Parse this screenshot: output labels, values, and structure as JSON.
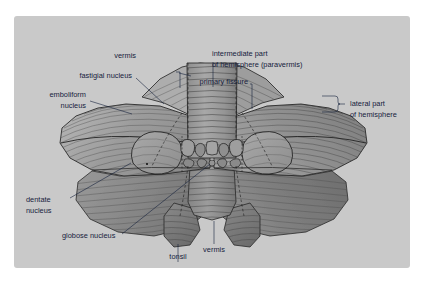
{
  "figure": {
    "background_color": "#c9c9c9",
    "page_color": "#ffffff",
    "label_color": "#16213c",
    "labels": [
      {
        "id": "vermis-superior",
        "text": "vermis"
      },
      {
        "id": "intermediate-part-1",
        "text": "intermediate part"
      },
      {
        "id": "intermediate-part-2",
        "text": "of hemisphere (paravermis)"
      },
      {
        "id": "fastigial-nucleus",
        "text": "fastigial nucleus"
      },
      {
        "id": "primary-fissure",
        "text": "primary fissure"
      },
      {
        "id": "emboliform-1",
        "text": "emboliform"
      },
      {
        "id": "emboliform-2",
        "text": "nucleus"
      },
      {
        "id": "lateral-part-1",
        "text": "lateral part"
      },
      {
        "id": "lateral-part-2",
        "text": "of hemisphere"
      },
      {
        "id": "dentate-1",
        "text": "dentate"
      },
      {
        "id": "dentate-2",
        "text": "nucleus"
      },
      {
        "id": "globose-nucleus",
        "text": "globose nucleus"
      },
      {
        "id": "tonsil",
        "text": "tonsil"
      },
      {
        "id": "vermis-inferior",
        "text": "vermis"
      }
    ],
    "structures": [
      {
        "id": "left-hemisphere",
        "name": "lateral part of hemisphere (left)"
      },
      {
        "id": "right-hemisphere",
        "name": "lateral part of hemisphere (right)"
      },
      {
        "id": "superior-vermis",
        "name": "superior vermis"
      },
      {
        "id": "inferior-vermis",
        "name": "inferior vermis"
      },
      {
        "id": "left-tonsil",
        "name": "left tonsil"
      },
      {
        "id": "right-tonsil",
        "name": "right tonsil"
      },
      {
        "id": "left-dentate",
        "name": "left dentate nucleus"
      },
      {
        "id": "right-dentate",
        "name": "right dentate nucleus"
      }
    ]
  }
}
